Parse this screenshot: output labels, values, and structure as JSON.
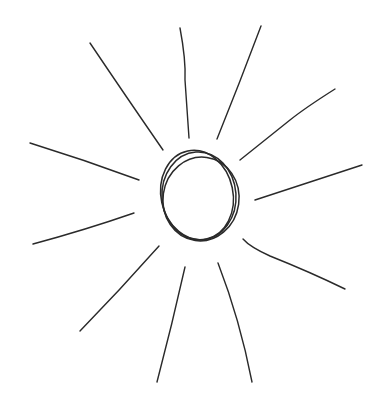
{
  "drawing": {
    "subject": "sun",
    "stroke_color": "#2a2a2a",
    "background": "#ffffff",
    "sun_body": {
      "rings": [
        {
          "cx": 199,
          "cy": 196,
          "rx": 37,
          "ry": 44,
          "rotate": -4
        },
        {
          "cx": 201,
          "cy": 199,
          "rx": 38,
          "ry": 42,
          "rotate": 8
        },
        {
          "cx": 197,
          "cy": 195,
          "rx": 36,
          "ry": 45,
          "rotate": -12
        }
      ]
    },
    "rays": [
      {
        "d": "M90,43 Q125,95 163,150"
      },
      {
        "d": "M180,28 Q186,60 185,80 Q187,110 189,138"
      },
      {
        "d": "M261,26 Q240,82 217,139"
      },
      {
        "d": "M335,89 Q305,108 290,120 Q265,140 240,160"
      },
      {
        "d": "M30,143 Q85,160 139,180"
      },
      {
        "d": "M362,165 Q310,182 255,200"
      },
      {
        "d": "M134,213 Q85,230 33,244"
      },
      {
        "d": "M159,246 Q120,290 80,331"
      },
      {
        "d": "M185,267 Q172,325 157,382"
      },
      {
        "d": "M218,263 Q240,320 252,382"
      },
      {
        "d": "M243,239 Q250,247 270,256 Q310,272 345,289"
      }
    ]
  }
}
